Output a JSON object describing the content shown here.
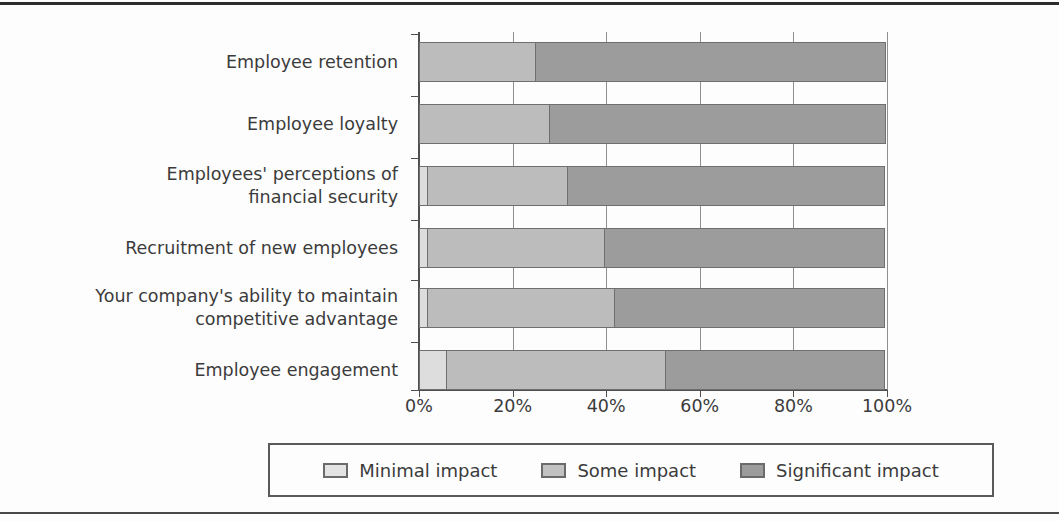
{
  "chart_data": {
    "type": "bar",
    "orientation": "horizontal",
    "stacked": true,
    "stack_mode": "percent",
    "title": "",
    "subtitle": "",
    "xlabel": "",
    "ylabel": "",
    "xlim": [
      0,
      100
    ],
    "xticks": [
      0,
      20,
      40,
      60,
      80,
      100
    ],
    "xtick_labels": [
      "0%",
      "20%",
      "40%",
      "60%",
      "80%",
      "100%"
    ],
    "grid": true,
    "grid_axis": "x",
    "legend_position": "bottom",
    "categories": [
      "Employee retention",
      "Employee loyalty",
      "Employees' perceptions of\nfinancial security",
      "Recruitment of new employees",
      "Your company's ability to maintain\ncompetitive advantage",
      "Employee engagement"
    ],
    "series": [
      {
        "name": "Minimal impact",
        "color": "#dddddd",
        "values": [
          0,
          0,
          2,
          2,
          2,
          6
        ]
      },
      {
        "name": "Some impact",
        "color": "#bcbcbc",
        "values": [
          25,
          28,
          30,
          38,
          40,
          47
        ]
      },
      {
        "name": "Significant impact",
        "color": "#9c9c9c",
        "values": [
          75,
          72,
          68,
          60,
          58,
          47
        ]
      }
    ],
    "cumulative_boundaries": [
      [
        0,
        25,
        100
      ],
      [
        0,
        28,
        100
      ],
      [
        2,
        32,
        100
      ],
      [
        2,
        40,
        100
      ],
      [
        2,
        42,
        100
      ],
      [
        6,
        53,
        100
      ]
    ]
  },
  "legend": {
    "items": [
      {
        "label": "Minimal impact",
        "color": "#e3e3e3",
        "swatch_class": "minimal"
      },
      {
        "label": "Some impact",
        "color": "#c2c2c2",
        "swatch_class": "some"
      },
      {
        "label": "Significant impact",
        "color": "#9c9c9c",
        "swatch_class": "significant"
      }
    ]
  },
  "axis": {
    "tick_labels": [
      "0%",
      "20%",
      "40%",
      "60%",
      "80%",
      "100%"
    ]
  }
}
